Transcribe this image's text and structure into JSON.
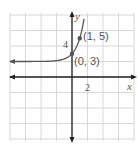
{
  "chart_data": {
    "type": "line",
    "title": "",
    "function": "y = 3^x + 2",
    "xlabel": "x",
    "ylabel": "y",
    "xlim": [
      -8,
      8
    ],
    "ylim": [
      -8,
      8
    ],
    "grid": true,
    "grid_step": 2,
    "tick_labels": {
      "x": [
        "2"
      ],
      "y": [
        "4"
      ]
    },
    "asymptote_y": 2,
    "points": [
      {
        "x": 0,
        "y": 3,
        "label": "(0, 3)"
      },
      {
        "x": 1,
        "y": 5,
        "label": "(1, 5)"
      }
    ],
    "colors": {
      "grid": "#d8d8d8",
      "axis": "#222222",
      "curve": "#555555",
      "point": "#555555"
    }
  }
}
